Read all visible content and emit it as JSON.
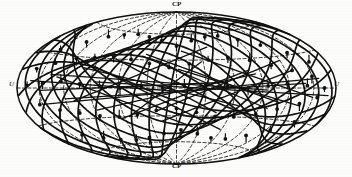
{
  "figure": {
    "type": "aitoff-hammer-sky-projection",
    "background_color": "#fdfdfb",
    "ink_color": "#111111",
    "width": 352,
    "height": 177
  },
  "labels": {
    "north_pole": "CP",
    "south_pole": "CP",
    "west_edge": "U",
    "east_edge": "U"
  },
  "chart_data": {
    "type": "scatter",
    "title": "",
    "xlabel": "",
    "ylabel": "",
    "projection": "Hammer-Aitoff equal-area ellipse",
    "grid": true,
    "grid_style": "dashed",
    "legend": "none",
    "xlim": [
      -180,
      180
    ],
    "ylim": [
      -90,
      90
    ],
    "graticule": {
      "meridian_step_deg": 30,
      "parallel_step_deg": 30,
      "meridians_deg": [
        -150,
        -120,
        -90,
        -60,
        -30,
        0,
        30,
        60,
        90,
        120,
        150
      ],
      "parallels_deg": [
        -60,
        -30,
        0,
        30,
        60
      ]
    },
    "great_circles": [
      {
        "name": "gc-1",
        "inclination_deg": 28,
        "node_lon_deg": -168
      },
      {
        "name": "gc-2",
        "inclination_deg": 35,
        "node_lon_deg": -150
      },
      {
        "name": "gc-3",
        "inclination_deg": 42,
        "node_lon_deg": -132
      },
      {
        "name": "gc-4",
        "inclination_deg": 50,
        "node_lon_deg": -114
      },
      {
        "name": "gc-5",
        "inclination_deg": 58,
        "node_lon_deg": -96
      },
      {
        "name": "gc-6",
        "inclination_deg": 64,
        "node_lon_deg": -78
      },
      {
        "name": "gc-7",
        "inclination_deg": 70,
        "node_lon_deg": -60
      },
      {
        "name": "gc-8",
        "inclination_deg": 74,
        "node_lon_deg": -42
      },
      {
        "name": "gc-9",
        "inclination_deg": 78,
        "node_lon_deg": -24
      },
      {
        "name": "gc-10",
        "inclination_deg": 80,
        "node_lon_deg": -6
      },
      {
        "name": "gc-11",
        "inclination_deg": 78,
        "node_lon_deg": 12
      },
      {
        "name": "gc-12",
        "inclination_deg": 72,
        "node_lon_deg": 30
      },
      {
        "name": "gc-13",
        "inclination_deg": 66,
        "node_lon_deg": 48
      },
      {
        "name": "gc-14",
        "inclination_deg": 58,
        "node_lon_deg": 66
      },
      {
        "name": "gc-15",
        "inclination_deg": 50,
        "node_lon_deg": 84
      },
      {
        "name": "gc-16",
        "inclination_deg": 40,
        "node_lon_deg": 102
      },
      {
        "name": "gc-17",
        "inclination_deg": 32,
        "node_lon_deg": 124
      },
      {
        "name": "gc-18",
        "inclination_deg": 24,
        "node_lon_deg": 146
      }
    ],
    "chords": [
      {
        "lon1": -162,
        "lat1": 6,
        "lon2": 8,
        "lat2": -4
      },
      {
        "lon1": -150,
        "lat1": -2,
        "lon2": 52,
        "lat2": 6
      },
      {
        "lon1": -138,
        "lat1": 12,
        "lon2": 96,
        "lat2": -2
      },
      {
        "lon1": -120,
        "lat1": -10,
        "lon2": 140,
        "lat2": 4
      },
      {
        "lon1": -104,
        "lat1": 20,
        "lon2": 66,
        "lat2": -18
      },
      {
        "lon1": -88,
        "lat1": -22,
        "lon2": 84,
        "lat2": 14
      },
      {
        "lon1": -70,
        "lat1": 30,
        "lon2": 44,
        "lat2": -26
      },
      {
        "lon1": -54,
        "lat1": -30,
        "lon2": 28,
        "lat2": 28
      },
      {
        "lon1": -36,
        "lat1": 36,
        "lon2": 112,
        "lat2": -14
      },
      {
        "lon1": -18,
        "lat1": -36,
        "lon2": 128,
        "lat2": 16
      },
      {
        "lon1": 6,
        "lat1": 40,
        "lon2": 150,
        "lat2": -8
      },
      {
        "lon1": 20,
        "lat1": -42,
        "lon2": -130,
        "lat2": 10
      },
      {
        "lon1": 40,
        "lat1": 44,
        "lon2": -110,
        "lat2": -12
      },
      {
        "lon1": 58,
        "lat1": -44,
        "lon2": -92,
        "lat2": 22
      },
      {
        "lon1": 78,
        "lat1": 18,
        "lon2": -64,
        "lat2": -32
      },
      {
        "lon1": 100,
        "lat1": -20,
        "lon2": -40,
        "lat2": 34
      },
      {
        "lon1": 120,
        "lat1": 26,
        "lon2": -20,
        "lat2": -24
      },
      {
        "lon1": 138,
        "lat1": -16,
        "lon2": 2,
        "lat2": 20
      },
      {
        "lon1": 158,
        "lat1": 8,
        "lon2": -150,
        "lat2": -14
      },
      {
        "lon1": 170,
        "lat1": -6,
        "lon2": -86,
        "lat2": 6
      }
    ],
    "nodes": [
      {
        "lon": -150,
        "lat": 34
      },
      {
        "lon": -128,
        "lat": 44
      },
      {
        "lon": -108,
        "lat": 52
      },
      {
        "lon": -88,
        "lat": 56
      },
      {
        "lon": -66,
        "lat": 58
      },
      {
        "lon": -44,
        "lat": 56
      },
      {
        "lon": -22,
        "lat": 52
      },
      {
        "lon": 0,
        "lat": 46
      },
      {
        "lon": 22,
        "lat": 52
      },
      {
        "lon": 46,
        "lat": 56
      },
      {
        "lon": 68,
        "lat": 56
      },
      {
        "lon": 92,
        "lat": 50
      },
      {
        "lon": 114,
        "lat": 42
      },
      {
        "lon": 138,
        "lat": 32
      },
      {
        "lon": 156,
        "lat": 22
      },
      {
        "lon": -160,
        "lat": 16
      },
      {
        "lon": -140,
        "lat": 22
      },
      {
        "lon": -118,
        "lat": 28
      },
      {
        "lon": -96,
        "lat": 30
      },
      {
        "lon": -74,
        "lat": 32
      },
      {
        "lon": -52,
        "lat": 30
      },
      {
        "lon": -30,
        "lat": 26
      },
      {
        "lon": -8,
        "lat": 22
      },
      {
        "lon": 14,
        "lat": 26
      },
      {
        "lon": 36,
        "lat": 30
      },
      {
        "lon": 60,
        "lat": 32
      },
      {
        "lon": 84,
        "lat": 28
      },
      {
        "lon": 106,
        "lat": 22
      },
      {
        "lon": 128,
        "lat": 16
      },
      {
        "lon": 150,
        "lat": 10
      },
      {
        "lon": -166,
        "lat": 2
      },
      {
        "lon": -146,
        "lat": 4
      },
      {
        "lon": -124,
        "lat": 6
      },
      {
        "lon": -102,
        "lat": 4
      },
      {
        "lon": -80,
        "lat": 2
      },
      {
        "lon": -58,
        "lat": 0
      },
      {
        "lon": -36,
        "lat": 2
      },
      {
        "lon": -14,
        "lat": 0
      },
      {
        "lon": 8,
        "lat": 2
      },
      {
        "lon": 30,
        "lat": 4
      },
      {
        "lon": 52,
        "lat": 2
      },
      {
        "lon": 74,
        "lat": 0
      },
      {
        "lon": 96,
        "lat": 2
      },
      {
        "lon": 118,
        "lat": 4
      },
      {
        "lon": 142,
        "lat": 2
      },
      {
        "lon": 164,
        "lat": 0
      },
      {
        "lon": -154,
        "lat": -14
      },
      {
        "lon": -132,
        "lat": -20
      },
      {
        "lon": -110,
        "lat": -24
      },
      {
        "lon": -88,
        "lat": -28
      },
      {
        "lon": -66,
        "lat": -30
      },
      {
        "lon": -44,
        "lat": -28
      },
      {
        "lon": -22,
        "lat": -24
      },
      {
        "lon": 0,
        "lat": -22
      },
      {
        "lon": 22,
        "lat": -26
      },
      {
        "lon": 44,
        "lat": -30
      },
      {
        "lon": 66,
        "lat": -30
      },
      {
        "lon": 90,
        "lat": -26
      },
      {
        "lon": 112,
        "lat": -20
      },
      {
        "lon": 136,
        "lat": -14
      },
      {
        "lon": 156,
        "lat": -8
      },
      {
        "lon": -136,
        "lat": -44
      },
      {
        "lon": -112,
        "lat": -50
      },
      {
        "lon": -90,
        "lat": -54
      },
      {
        "lon": -66,
        "lat": -56
      },
      {
        "lon": -42,
        "lat": -54
      },
      {
        "lon": -18,
        "lat": -50
      },
      {
        "lon": 6,
        "lat": -46
      },
      {
        "lon": 30,
        "lat": -50
      },
      {
        "lon": 54,
        "lat": -54
      },
      {
        "lon": 78,
        "lat": -54
      },
      {
        "lon": 102,
        "lat": -48
      },
      {
        "lon": 126,
        "lat": -40
      },
      {
        "lon": 146,
        "lat": -30
      }
    ]
  }
}
